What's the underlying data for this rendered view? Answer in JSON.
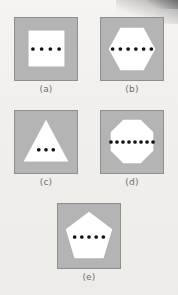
{
  "figure": {
    "background_color": "#f2f0ec",
    "panel_fill_color": "#b4b4b4",
    "panel_border_color": "#8f8f90",
    "shape_color": "#ffffff",
    "dot_color": "#111111",
    "caption_color": "#6f6d6c",
    "panels": [
      {
        "id": "a",
        "caption": "(a)",
        "shape_name": "square",
        "sides": 4,
        "dot_count": 4
      },
      {
        "id": "b",
        "caption": "(b)",
        "shape_name": "hexagon",
        "sides": 6,
        "dot_count": 6
      },
      {
        "id": "c",
        "caption": "(c)",
        "shape_name": "triangle",
        "sides": 3,
        "dot_count": 3
      },
      {
        "id": "d",
        "caption": "(d)",
        "shape_name": "octagon",
        "sides": 8,
        "dot_count": 8
      },
      {
        "id": "e",
        "caption": "(e)",
        "shape_name": "pentagon",
        "sides": 5,
        "dot_count": 5
      }
    ]
  }
}
